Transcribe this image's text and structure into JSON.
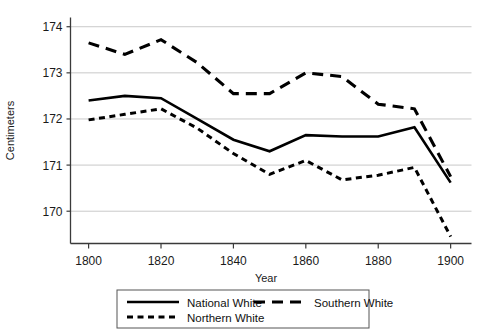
{
  "chart_data": {
    "type": "line",
    "title": "",
    "xlabel": "Year",
    "ylabel": "Centimeters",
    "xlim": [
      1795,
      1903
    ],
    "ylim": [
      169.3,
      174.2
    ],
    "grid": "horizontal",
    "legend_position": "bottom",
    "xticks": [
      "1800",
      "1820",
      "1840",
      "1860",
      "1880",
      "1900"
    ],
    "xtick_values": [
      1800,
      1820,
      1840,
      1860,
      1880,
      1900
    ],
    "yticks": [
      "170",
      "171",
      "172",
      "173",
      "174"
    ],
    "ytick_values": [
      170,
      171,
      172,
      173,
      174
    ],
    "x": [
      1800,
      1810,
      1820,
      1830,
      1840,
      1850,
      1860,
      1870,
      1880,
      1890,
      1900
    ],
    "series": [
      {
        "name": "National White",
        "style": "solid",
        "color": "#000000",
        "values": [
          172.4,
          172.5,
          172.45,
          172.0,
          171.55,
          171.3,
          171.65,
          171.62,
          171.62,
          171.82,
          170.62
        ]
      },
      {
        "name": "Northern White",
        "style": "dotted",
        "color": "#000000",
        "values": [
          171.98,
          172.1,
          172.22,
          171.8,
          171.25,
          170.8,
          171.1,
          170.68,
          170.78,
          170.95,
          169.45
        ]
      },
      {
        "name": "Southern White",
        "style": "dashed",
        "color": "#000000",
        "values": [
          173.65,
          173.4,
          173.72,
          173.22,
          172.55,
          172.55,
          173.0,
          172.92,
          172.32,
          172.22,
          170.75
        ]
      }
    ]
  },
  "legend": {
    "entries": [
      {
        "label": "National White",
        "style": "solid"
      },
      {
        "label": "Northern White",
        "style": "dotted"
      },
      {
        "label": "Southern White",
        "style": "dashed"
      }
    ]
  }
}
